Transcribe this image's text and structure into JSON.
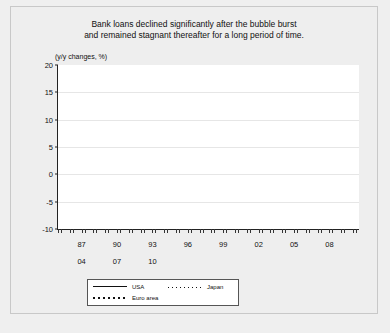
{
  "figure": {
    "title_line1": "Bank loans declined significantly after the bubble burst",
    "title_line2": "and remained stagnant thereafter for a long period of time.",
    "unit_label": "(y/y changes, %)"
  },
  "legend": {
    "usa": "USA",
    "japan": "Japan",
    "euro": "Euro area"
  },
  "chart_data": {
    "type": "line",
    "title": "Bank loans declined significantly after the bubble burst and remained stagnant thereafter for a long period of time.",
    "xlabel": "",
    "ylabel": "(y/y changes, %)",
    "ylim": [
      -10,
      20
    ],
    "yticks": [
      20,
      15,
      10,
      5,
      0,
      -5,
      -10
    ],
    "grid": true,
    "legend_position": "bottom-center",
    "xlim": [
      1985.0,
      2010.5
    ],
    "xtick_labels_row1": [
      "87",
      "90",
      "93",
      "96",
      "99",
      "02",
      "05",
      "08"
    ],
    "xtick_values_row1": [
      1987,
      1990,
      1993,
      1996,
      1999,
      2002,
      2005,
      2008
    ],
    "xtick_labels_row2": [
      "04",
      "07",
      "10"
    ],
    "xtick_values_row2": [
      2004,
      2007,
      2010
    ],
    "note_axis": "Lower row of year labels (04, 07, 10) is offset beneath the primary year axis",
    "series": [
      {
        "name": "USA",
        "style": "solid",
        "x": [
          1985.0,
          1985.5,
          1986.0,
          1986.5,
          1987.0,
          1987.3,
          1987.6,
          1988.0,
          1988.3,
          1988.6,
          1989.0,
          1989.3,
          1989.6,
          1990.0,
          1990.3,
          1990.6,
          1991.0,
          1991.3,
          1991.6,
          1992.0,
          1992.3,
          1992.6,
          1993.0,
          1993.3
        ],
        "y": [
          0.7,
          2.5,
          4.6,
          7.0,
          9.5,
          9.0,
          6.0,
          5.6,
          7.5,
          11.8,
          11.5,
          12.0,
          11.0,
          12.5,
          13.2,
          11.0,
          11.5,
          10.5,
          10.0,
          9.8,
          8.0,
          2.5,
          -6.8,
          -2.0
        ]
      },
      {
        "name": "Euro area",
        "style": "dotted-thick",
        "x": [
          1985.0,
          1985.5,
          1986.0,
          1986.5,
          1987.0,
          1987.5,
          1988.0,
          1988.5,
          1989.0,
          1989.5,
          1990.0,
          1990.5,
          1991.0,
          1991.5,
          1992.0,
          1992.5,
          1993.0
        ],
        "y": [
          5.2,
          4.2,
          3.8,
          4.0,
          4.5,
          4.6,
          5.0,
          6.5,
          8.2,
          9.8,
          10.4,
          10.5,
          10.2,
          9.0,
          7.0,
          4.5,
          2.5
        ]
      },
      {
        "name": "Japan",
        "style": "dotted-fine",
        "x": [
          1985.0,
          1985.5,
          1986.0,
          1986.5,
          1987.0,
          1987.5,
          1988.0,
          1988.5,
          1989.0,
          1989.5,
          1990.0,
          1990.5,
          1991.0,
          1991.5,
          1992.0,
          1992.5,
          1993.0,
          1993.5,
          1994.0,
          1994.5,
          1995.0,
          1995.5,
          1996.0,
          1996.5,
          1997.0,
          1997.3,
          1997.6,
          1998.0,
          1998.3,
          1998.6,
          1999.0,
          1999.3,
          1999.6,
          2000.0,
          2000.5,
          2001.0,
          2001.5,
          2002.0,
          2002.5,
          2003.0,
          2003.5,
          2004.0,
          2004.5,
          2005.0,
          2005.5,
          2006.0,
          2006.5,
          2007.0,
          2007.5,
          2008.0,
          2008.5,
          2009.0,
          2009.5,
          2010.0,
          2010.3
        ],
        "y": [
          13.2,
          12.2,
          11.5,
          11.8,
          12.8,
          13.8,
          14.2,
          13.2,
          12.0,
          11.5,
          10.8,
          10.5,
          10.2,
          9.5,
          8.6,
          7.5,
          5.2,
          3.8,
          3.0,
          3.2,
          3.4,
          3.2,
          3.5,
          3.8,
          3.4,
          2.3,
          2.0,
          2.2,
          2.4,
          5.5,
          2.0,
          -1.5,
          -5.0,
          -8.6,
          -6.0,
          -3.2,
          -0.6,
          0.8,
          0.4,
          -1.4,
          -1.8,
          -1.6,
          -1.2,
          -1.0,
          -1.5,
          -0.4,
          1.2,
          3.2,
          4.0,
          2.6,
          1.8,
          3.8,
          5.2,
          6.2,
          4.0
        ]
      }
    ]
  }
}
